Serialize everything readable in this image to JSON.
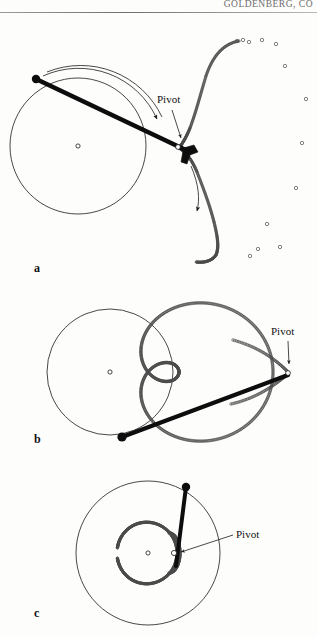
{
  "page": {
    "running_head": "GOLDENBERG, CO",
    "width": 317,
    "height": 637,
    "background": "#fdfdfc",
    "ink": "#111111"
  },
  "figure": {
    "type": "line-diagram",
    "panels": [
      {
        "id": "a",
        "label": "a",
        "label_pos": [
          34,
          272
        ],
        "circle": {
          "cx": 78,
          "cy": 146,
          "r": 68,
          "stroke": "#1a1a1a"
        },
        "center_marker": {
          "cx": 78,
          "cy": 146,
          "r": 2.1
        },
        "bar": {
          "from": [
            36,
            79
          ],
          "to": [
            188,
            151
          ],
          "width": 4.6,
          "end_dot_r": 4.2,
          "end_dot_fill": "#0d0d0d"
        },
        "pivot": {
          "cx": 179,
          "cy": 147,
          "r": 2.4
        },
        "pivot_label": {
          "text": "Pivot",
          "x": 158,
          "y": 103
        },
        "pivot_arrow": {
          "from": [
            170,
            110
          ],
          "to": [
            180,
            139
          ]
        },
        "rotation_arrow": {
          "path": "M 43 76 A 86 86 0 0 1 158 121",
          "direction": "clockwise"
        },
        "motion_arrow": {
          "path": "M 192 167 C 198 186 198 198 196 212",
          "direction": "downward"
        },
        "elbow": [
          [
            181,
            148
          ],
          [
            193,
            146
          ],
          [
            196,
            152
          ],
          [
            189,
            156
          ],
          [
            186,
            163
          ]
        ],
        "trace_style": "open-circle-dots",
        "trace_dot_r": 1.15,
        "speckles": [
          [
            237,
            41
          ],
          [
            243,
            40
          ],
          [
            249,
            42
          ],
          [
            262,
            40
          ],
          [
            276,
            44
          ],
          [
            285,
            66
          ],
          [
            306,
            99
          ],
          [
            302,
            143
          ],
          [
            296,
            188
          ],
          [
            267,
            224
          ],
          [
            258,
            249
          ],
          [
            280,
            247
          ],
          [
            250,
            256
          ]
        ]
      },
      {
        "id": "b",
        "label": "b",
        "label_pos": [
          34,
          443
        ],
        "circle": {
          "cx": 110,
          "cy": 372,
          "r": 63,
          "stroke": "#1a1a1a"
        },
        "center_marker": {
          "cx": 110,
          "cy": 372,
          "r": 2.1
        },
        "bar": {
          "from": [
            122,
            437
          ],
          "to": [
            288,
            376
          ],
          "width": 4.2,
          "end_dot_r": 4.6,
          "end_dot_fill": "#0d0d0d"
        },
        "pivot": {
          "cx": 288,
          "cy": 373,
          "r": 2.4
        },
        "pivot_label": {
          "text": "Pivot",
          "x": 272,
          "y": 335
        },
        "pivot_arrow": {
          "from": [
            288,
            340
          ],
          "to": [
            289,
            365
          ]
        },
        "trace_style": "open-circle-dots",
        "trace_dot_r": 1.25,
        "trace_shape": "limacon-teardrop"
      },
      {
        "id": "c",
        "label": "c",
        "label_pos": [
          34,
          617
        ],
        "circle": {
          "cx": 148,
          "cy": 553,
          "r": 72,
          "stroke": "#1a1a1a"
        },
        "center_marker": {
          "cx": 148,
          "cy": 553,
          "r": 2.1
        },
        "bar": {
          "from": [
            186,
            487
          ],
          "to": [
            176,
            566
          ],
          "width": 4.0,
          "end_dot_r": 4.2,
          "end_dot_fill": "#0d0d0d"
        },
        "pivot": {
          "cx": 174,
          "cy": 553,
          "r": 2.6
        },
        "pivot_label": {
          "text": "Pivot",
          "x": 237,
          "y": 537
        },
        "pivot_leader": {
          "from": [
            233,
            534
          ],
          "to": [
            181,
            552
          ]
        },
        "trace_style": "open-circle-dots",
        "trace_dot_r": 1.15,
        "trace_shape": "inner-circle",
        "inner_circle": {
          "cx": 142,
          "cy": 553,
          "r": 35
        }
      }
    ]
  }
}
